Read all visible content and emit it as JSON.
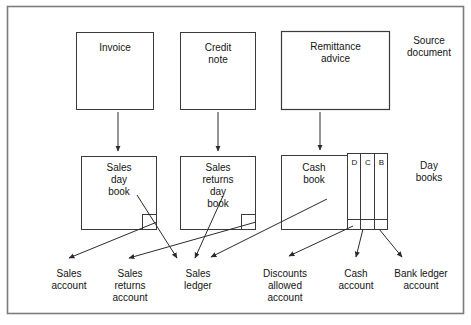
{
  "figure": {
    "type": "flow-diagram",
    "frame": {
      "x": 7,
      "y": 6,
      "width": 457,
      "height": 308,
      "border_color": "#6e6e6e",
      "background": "#ffffff"
    },
    "line_color": "#2b2b2b"
  },
  "row_labels": {
    "source": "Source\ndocument",
    "daybooks": "Day\nbooks"
  },
  "source_documents": [
    {
      "id": "invoice",
      "label": "Invoice",
      "x": 76,
      "y": 32,
      "width": 78,
      "height": 78
    },
    {
      "id": "credit-note",
      "label": "Credit\nnote",
      "x": 180,
      "y": 32,
      "width": 76,
      "height": 78
    },
    {
      "id": "remittance-advice",
      "label": "Remittance\nadvice",
      "x": 281,
      "y": 31,
      "width": 109,
      "height": 79
    }
  ],
  "day_books": [
    {
      "id": "sales-day-book",
      "label": "Sales\nday\nbook",
      "x": 81,
      "y": 156,
      "width": 76,
      "height": 74,
      "notch": true
    },
    {
      "id": "sales-returns-day-book",
      "label": "Sales\nreturns\nday\nbook",
      "x": 180,
      "y": 156,
      "width": 76,
      "height": 74,
      "notch": true
    },
    {
      "id": "cash-book",
      "label": "Cash\nbook",
      "x": 281,
      "y": 155,
      "width": 66,
      "height": 75,
      "notch": false
    }
  ],
  "cash_book_columns": [
    {
      "id": "discount-column",
      "label": "D"
    },
    {
      "id": "cash-column",
      "label": "C"
    },
    {
      "id": "bank-column",
      "label": "B"
    }
  ],
  "ledger_accounts": [
    {
      "id": "sales-account",
      "label": "Sales\naccount",
      "x": 43,
      "y": 272
    },
    {
      "id": "sales-returns-account",
      "label": "Sales\nreturns\naccount",
      "x": 98,
      "y": 272
    },
    {
      "id": "sales-ledger",
      "label": "Sales\nledger",
      "x": 168,
      "y": 272
    },
    {
      "id": "discounts-allowed-account",
      "label": "Discounts\nallowed\naccount",
      "x": 245,
      "y": 272
    },
    {
      "id": "cash-account",
      "label": "Cash\naccount",
      "x": 330,
      "y": 272
    },
    {
      "id": "bank-ledger-account",
      "label": "Bank ledger\naccount",
      "x": 393,
      "y": 272
    }
  ],
  "vertical_flows": [
    {
      "id": "invoice-to-sales-day-book",
      "from": "invoice",
      "to": "sales-day-book",
      "x": 118,
      "y1": 112,
      "y2": 152
    },
    {
      "id": "credit-note-to-sales-returns-day-book",
      "from": "credit-note",
      "to": "sales-returns-day-book",
      "x": 218,
      "y1": 112,
      "y2": 152
    },
    {
      "id": "remittance-advice-to-cash-book",
      "from": "remittance-advice",
      "to": "cash-book",
      "x": 320,
      "y1": 112,
      "y2": 152
    }
  ],
  "posting_flows": [
    {
      "id": "sales-day-book-to-sales-account",
      "from": "sales-day-book",
      "to": "sales-account",
      "x1": 157,
      "y1": 222,
      "x2": 68,
      "y2": 259
    },
    {
      "id": "sales-day-book-to-sales-ledger",
      "from": "sales-day-book",
      "to": "sales-ledger",
      "x1": 138,
      "y1": 196,
      "x2": 178,
      "y2": 259
    },
    {
      "id": "sales-returns-day-book-to-sales-returns-account",
      "from": "sales-returns-day-book",
      "to": "sales-returns-account",
      "x1": 256,
      "y1": 222,
      "x2": 128,
      "y2": 259
    },
    {
      "id": "sales-returns-day-book-to-sales-ledger",
      "from": "sales-returns-day-book",
      "to": "sales-ledger",
      "x1": 222,
      "y1": 196,
      "x2": 196,
      "y2": 259
    },
    {
      "id": "cash-book-to-sales-ledger",
      "from": "cash-book",
      "to": "sales-ledger",
      "x1": 327,
      "y1": 199,
      "x2": 212,
      "y2": 258
    },
    {
      "id": "cash-book-to-discounts-allowed-account",
      "from": "cash-book",
      "to": "discounts-allowed-account",
      "x1": 352,
      "y1": 226,
      "x2": 289,
      "y2": 257
    },
    {
      "id": "cash-column-to-cash-account",
      "from": "cash-column",
      "to": "cash-account",
      "x1": 362,
      "y1": 230,
      "x2": 355,
      "y2": 258
    },
    {
      "id": "bank-column-to-bank-ledger-account",
      "from": "bank-column",
      "to": "bank-ledger-account",
      "x1": 378,
      "y1": 230,
      "x2": 402,
      "y2": 258
    }
  ]
}
